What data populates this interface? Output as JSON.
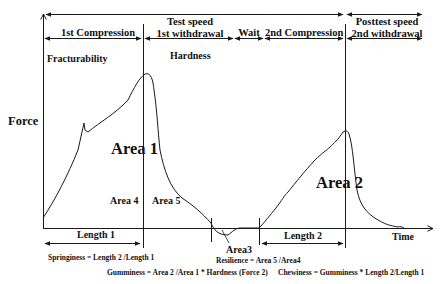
{
  "diagram": {
    "type": "texture-profile-analysis-curve",
    "axes": {
      "y_label": "Force",
      "x_label": "Time"
    },
    "phases": {
      "top_row": [
        {
          "label_line1": "",
          "label_line2": "1st Compression"
        },
        {
          "label_line1": "Test speed",
          "label_line2": "1st withdrawal"
        },
        {
          "label_line1": "",
          "label_line2": "Wait"
        },
        {
          "label_line1": "",
          "label_line2": "2nd Compression"
        },
        {
          "label_line1": "Posttest speed",
          "label_line2": "2nd withdrawal"
        }
      ]
    },
    "annotations": {
      "fracturability": "Fracturability",
      "hardness": "Hardness",
      "area1": "Area 1",
      "area2": "Area 2",
      "area3": "Area3",
      "area4": "Area 4",
      "area5": "Area 5",
      "length1": "Length 1",
      "length2": "Length 2"
    },
    "formulas": {
      "springiness": "Springiness = Length 2 /Length 1",
      "resilience": "Resilience = Area 5 /Area4",
      "gumminess": "Gumminess = Area 2 /Area 1 * Hardness (Force 2)",
      "chewiness": "Chewiness = Gumminess * Length 2/Length 1"
    },
    "colors": {
      "line": "#1a1a1a",
      "background": "#ffffff"
    }
  }
}
